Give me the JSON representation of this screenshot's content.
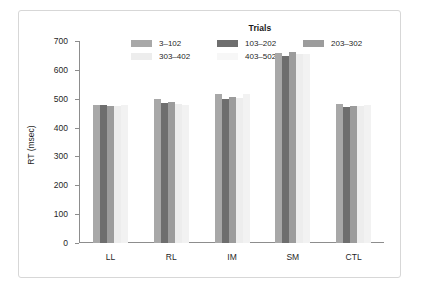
{
  "chart_data": {
    "type": "bar",
    "title": "",
    "xlabel": "",
    "ylabel": "RT (msec)",
    "ylim": [
      0,
      700
    ],
    "yticks": [
      0,
      100,
      200,
      300,
      400,
      500,
      600,
      700
    ],
    "ytick_labels": [
      "0",
      "100",
      "200",
      "300",
      "400",
      "500",
      "600",
      "700"
    ],
    "grid": false,
    "legend_title": "Trials",
    "legend_position": "top-center",
    "categories": [
      "LL",
      "RL",
      "IM",
      "SM",
      "CTL"
    ],
    "series": [
      {
        "name": "3–102",
        "color": "#a8a8a8",
        "values": [
          479,
          499,
          518,
          657,
          483
        ]
      },
      {
        "name": "103–202",
        "color": "#6e6e6e",
        "values": [
          480,
          485,
          498,
          649,
          473
        ]
      },
      {
        "name": "203–302",
        "color": "#9c9c9c",
        "values": [
          476,
          489,
          505,
          661,
          476
        ]
      },
      {
        "name": "303–402",
        "color": "#ededed",
        "values": [
          474,
          483,
          502,
          654,
          474
        ]
      },
      {
        "name": "403–502",
        "color": "#f2f2f2",
        "values": [
          479,
          479,
          517,
          655,
          480
        ]
      }
    ]
  },
  "legend": {
    "title": "Trials",
    "rows": [
      [
        {
          "label": "3–102",
          "color": "#a8a8a8"
        },
        {
          "label": "103–202",
          "color": "#6e6e6e"
        },
        {
          "label": "203–302",
          "color": "#9c9c9c"
        }
      ],
      [
        {
          "label": "303–402",
          "color": "#ededed"
        },
        {
          "label": "403–502",
          "color": "#f7f7f7"
        }
      ]
    ]
  },
  "axes": {
    "y_title": "RT (msec)",
    "y_ticks": [
      "700",
      "600",
      "500",
      "400",
      "300",
      "200",
      "100",
      "0"
    ],
    "x_ticks": [
      "LL",
      "RL",
      "IM",
      "SM",
      "CTL"
    ]
  },
  "style": {
    "axis_color": "#8d8d8d",
    "frame_color": "#d7d7d7",
    "text_color": "#1f1f1f",
    "background": "#ffffff"
  }
}
